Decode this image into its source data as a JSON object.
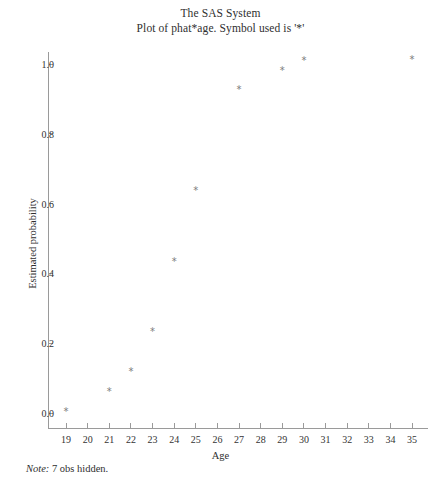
{
  "chart_data": {
    "type": "scatter",
    "title": "The SAS System",
    "subtitle": "Plot of phat*age. Symbol used is '*'",
    "xlabel": "Age",
    "ylabel": "Estimated probability",
    "marker_symbol": "*",
    "grid": false,
    "legend": "none",
    "xlim": [
      18.4,
      35.6
    ],
    "ylim": [
      -0.03,
      1.06
    ],
    "xticks": [
      19,
      20,
      21,
      22,
      23,
      24,
      25,
      26,
      27,
      28,
      29,
      30,
      31,
      32,
      33,
      34,
      35
    ],
    "xtick_labels": [
      "19",
      "20",
      "21",
      "22",
      "23",
      "24",
      "25",
      "26",
      "27",
      "28",
      "29",
      "30",
      "31",
      "32",
      "33",
      "34",
      "35"
    ],
    "yticks": [
      0.0,
      0.2,
      0.4,
      0.6,
      0.8,
      1.0
    ],
    "ytick_labels": [
      "0.0",
      "0.2",
      "0.4",
      "0.6",
      "0.8",
      "1.0"
    ],
    "points": [
      {
        "x": 19,
        "y": 0.003
      },
      {
        "x": 21,
        "y": 0.06
      },
      {
        "x": 22,
        "y": 0.117
      },
      {
        "x": 23,
        "y": 0.233
      },
      {
        "x": 24,
        "y": 0.434
      },
      {
        "x": 25,
        "y": 0.637
      },
      {
        "x": 27,
        "y": 0.925
      },
      {
        "x": 29,
        "y": 0.98
      },
      {
        "x": 30,
        "y": 1.008
      },
      {
        "x": 35,
        "y": 1.011
      }
    ],
    "annotations": [
      {
        "label": "Note:",
        "text": "7 obs hidden."
      }
    ],
    "colors": {
      "axis": "#9a9a9a",
      "marker": "#7c7c7c",
      "text": "#2f2f2f",
      "background": "#ffffff"
    }
  },
  "footnote": {
    "label": "Note:",
    "text": "7 obs hidden."
  }
}
